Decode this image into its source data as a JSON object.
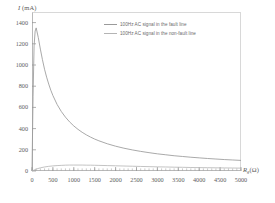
{
  "chart_data": {
    "type": "line",
    "title": "",
    "xlabel": "Rg (Ω)",
    "ylabel": "I (mA)",
    "xlim": [
      0,
      5000
    ],
    "ylim": [
      0,
      1500
    ],
    "grid": false,
    "legend_position": "top-right",
    "x_ticks": [
      0,
      500,
      1000,
      1500,
      2000,
      2500,
      3000,
      3500,
      4000,
      4500,
      5000
    ],
    "y_ticks": [
      0,
      200,
      400,
      600,
      800,
      1000,
      1200,
      1400
    ],
    "x_minor_tick_step": 100,
    "series": [
      {
        "name": "100Hz AC signal in the fault line",
        "color": "#9a9a9a",
        "x": [
          0,
          25,
          50,
          75,
          100,
          150,
          200,
          250,
          300,
          350,
          400,
          450,
          500,
          600,
          700,
          800,
          900,
          1000,
          1100,
          1200,
          1300,
          1400,
          1500,
          1600,
          1800,
          2000,
          2200,
          2400,
          2600,
          2800,
          3000,
          3200,
          3400,
          3600,
          3800,
          4000,
          4200,
          4400,
          4600,
          4800,
          5000
        ],
        "values": [
          0,
          700,
          1180,
          1320,
          1350,
          1260,
          1150,
          1050,
          960,
          885,
          820,
          762,
          712,
          628,
          562,
          508,
          463,
          425,
          393,
          365,
          341,
          320,
          301,
          285,
          257,
          234,
          215,
          199,
          185,
          173,
          162,
          153,
          144,
          137,
          130,
          124,
          118,
          113,
          108,
          104,
          100
        ]
      },
      {
        "name": "100Hz AC signal in the non-fault line",
        "color": "#b4b4b4",
        "x": [
          0,
          100,
          200,
          300,
          400,
          500,
          600,
          700,
          800,
          900,
          1000,
          1100,
          1200,
          1300,
          1400,
          1500,
          1600,
          1800,
          2000,
          2200,
          2400,
          2600,
          2800,
          3000,
          3200,
          3400,
          3600,
          3800,
          4000,
          4200,
          4400,
          4600,
          4800,
          5000
        ],
        "values": [
          0,
          18,
          30,
          38,
          44,
          48,
          51,
          53,
          55,
          56,
          56,
          56,
          56,
          55,
          55,
          54,
          53,
          51,
          49,
          47,
          45,
          43,
          41,
          39,
          38,
          36,
          35,
          33,
          32,
          31,
          30,
          29,
          28,
          27
        ]
      }
    ]
  }
}
